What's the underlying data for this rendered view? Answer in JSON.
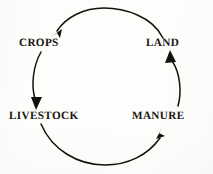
{
  "diagram": {
    "type": "cycle",
    "background_color": "#fdfdfc",
    "stroke_color": "#14110b",
    "text_color": "#19160f",
    "nodes": [
      {
        "id": "crops",
        "label": "CROPS",
        "position": "top-left"
      },
      {
        "id": "land",
        "label": "LAND",
        "position": "top-right"
      },
      {
        "id": "livestock",
        "label": "LIVESTOCK",
        "position": "bottom-left"
      },
      {
        "id": "manure",
        "label": "MANURE",
        "position": "bottom-right"
      }
    ],
    "edges": [
      {
        "id": "crops-to-livestock",
        "from": "crops",
        "to": "livestock",
        "arrowhead": "down",
        "side": "left"
      },
      {
        "id": "livestock-to-manure",
        "from": "livestock",
        "to": "manure",
        "arrowhead": "up-right",
        "side": "bottom"
      },
      {
        "id": "manure-to-land",
        "from": "manure",
        "to": "land",
        "arrowhead": "up",
        "side": "right"
      },
      {
        "id": "land-to-crops",
        "from": "land",
        "to": "crops",
        "arrowhead": "down-left",
        "side": "top"
      }
    ]
  }
}
